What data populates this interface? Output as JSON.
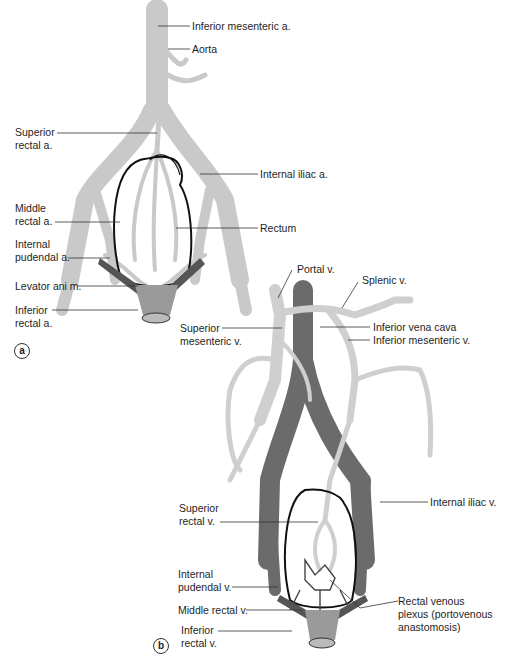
{
  "figure": {
    "panels": [
      {
        "id": "a",
        "badge": "a",
        "subject": "Arterial supply of the rectum",
        "labels": {
          "inferior_mesenteric_a": "Inferior mesenteric a.",
          "aorta": "Aorta",
          "superior_rectal_a_1": "Superior",
          "superior_rectal_a_2": "rectal a.",
          "internal_iliac_a": "Internal iliac a.",
          "middle_rectal_a_1": "Middle",
          "middle_rectal_a_2": "rectal a.",
          "rectum": "Rectum",
          "internal_pudendal_a_1": "Internal",
          "internal_pudendal_a_2": "pudendal a.",
          "levator_ani": "Levator ani m.",
          "inferior_rectal_a_1": "Inferior",
          "inferior_rectal_a_2": "rectal a."
        }
      },
      {
        "id": "b",
        "badge": "b",
        "subject": "Venous drainage of the rectum",
        "labels": {
          "portal_v": "Portal v.",
          "splenic_v": "Splenic v.",
          "superior_mesenteric_v_1": "Superior",
          "superior_mesenteric_v_2": "mesenteric v.",
          "inferior_vena_cava": "Inferior vena cava",
          "inferior_mesenteric_v": "Inferior mesenteric v.",
          "internal_iliac_v": "Internal iliac v.",
          "superior_rectal_v_1": "Superior",
          "superior_rectal_v_2": "rectal v.",
          "internal_pudendal_v_1": "Internal",
          "internal_pudendal_v_2": "pudendal v.",
          "middle_rectal_v": "Middle rectal v.",
          "rectal_venous_plexus_1": "Rectal venous",
          "rectal_venous_plexus_2": "plexus (portovenous",
          "rectal_venous_plexus_3": "anastomosis)",
          "inferior_rectal_v_1": "Inferior",
          "inferior_rectal_v_2": "rectal v."
        }
      }
    ],
    "colors": {
      "artery": "#c9c9c9",
      "portal_vein": "#cfcfcf",
      "systemic_vein": "#6b6b6b",
      "outline": "#111111",
      "leader": "#333333"
    }
  }
}
